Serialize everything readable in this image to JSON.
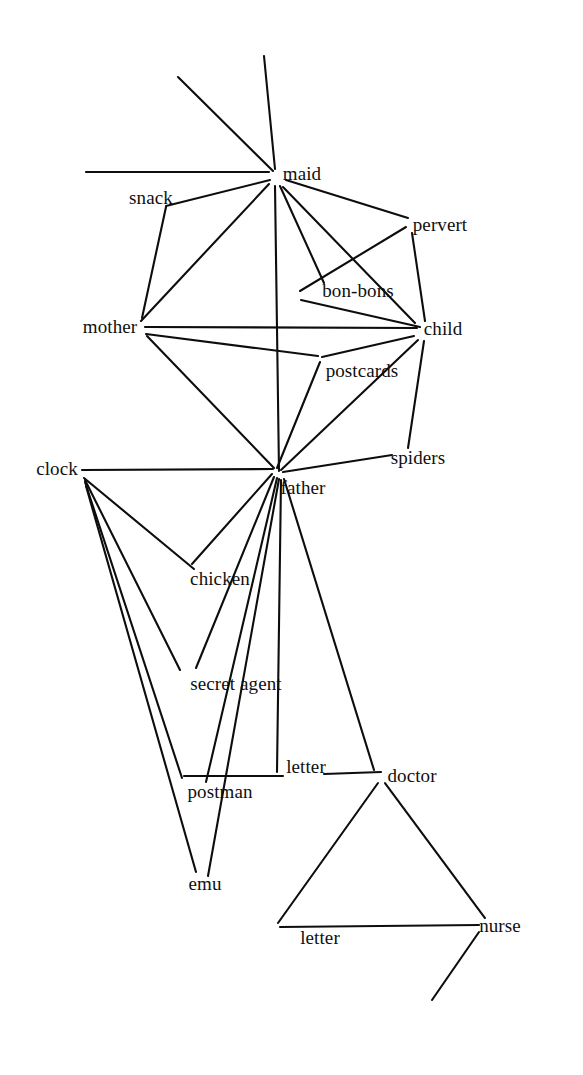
{
  "diagram": {
    "type": "node-link-graph",
    "title": "",
    "background_color": "#ffffff",
    "line_color": "#0d0d0d",
    "text_color": "#101010",
    "width": 583,
    "height": 1075,
    "nodes": [
      {
        "id": "maid",
        "label": "maid",
        "x": 302,
        "y": 173
      },
      {
        "id": "snack",
        "label": "snack",
        "x": 151,
        "y": 197
      },
      {
        "id": "pervert",
        "label": "pervert",
        "x": 440,
        "y": 224
      },
      {
        "id": "bon-bons",
        "label": "bon-bons",
        "x": 358,
        "y": 290
      },
      {
        "id": "mother",
        "label": "mother",
        "x": 110,
        "y": 326
      },
      {
        "id": "child",
        "label": "child",
        "x": 443,
        "y": 328
      },
      {
        "id": "postcards",
        "label": "postcards",
        "x": 362,
        "y": 370
      },
      {
        "id": "spiders",
        "label": "spiders",
        "x": 418,
        "y": 457
      },
      {
        "id": "clock",
        "label": "clock",
        "x": 57,
        "y": 468
      },
      {
        "id": "father",
        "label": "father",
        "x": 303,
        "y": 487
      },
      {
        "id": "chicken",
        "label": "chicken",
        "x": 220,
        "y": 578
      },
      {
        "id": "secret-agent",
        "label": "secret agent",
        "x": 236,
        "y": 683
      },
      {
        "id": "letter-upper",
        "label": "letter",
        "x": 306,
        "y": 766
      },
      {
        "id": "doctor",
        "label": "doctor",
        "x": 412,
        "y": 775
      },
      {
        "id": "postman",
        "label": "postman",
        "x": 220,
        "y": 791
      },
      {
        "id": "emu",
        "label": "emu",
        "x": 205,
        "y": 883
      },
      {
        "id": "letter-lower",
        "label": "letter",
        "x": 320,
        "y": 937
      },
      {
        "id": "nurse",
        "label": "nurse",
        "x": 500,
        "y": 925
      }
    ],
    "edges": [
      {
        "from": "maid",
        "to": "dangle-up-left",
        "x1": 273,
        "y1": 171,
        "x2": 178,
        "y2": 77
      },
      {
        "from": "maid",
        "to": "dangle-up",
        "x1": 275,
        "y1": 169,
        "x2": 264,
        "y2": 56
      },
      {
        "from": "maid",
        "to": "dangle-left",
        "x1": 269,
        "y1": 172,
        "x2": 86,
        "y2": 172
      },
      {
        "from": "maid",
        "to": "snack",
        "x1": 270,
        "y1": 180,
        "x2": 166,
        "y2": 206
      },
      {
        "from": "snack",
        "to": "mother",
        "x1": 166,
        "y1": 207,
        "x2": 142,
        "y2": 318
      },
      {
        "from": "maid",
        "to": "mother",
        "x1": 269,
        "y1": 184,
        "x2": 141,
        "y2": 321
      },
      {
        "from": "maid",
        "to": "father",
        "x1": 275,
        "y1": 186,
        "x2": 279,
        "y2": 471
      },
      {
        "from": "maid",
        "to": "bon-bons",
        "x1": 280,
        "y1": 186,
        "x2": 324,
        "y2": 283
      },
      {
        "from": "maid",
        "to": "child",
        "x1": 283,
        "y1": 187,
        "x2": 415,
        "y2": 323
      },
      {
        "from": "maid",
        "to": "pervert",
        "x1": 286,
        "y1": 180,
        "x2": 408,
        "y2": 218
      },
      {
        "from": "pervert",
        "to": "bon-bons-left",
        "x1": 406,
        "y1": 227,
        "x2": 300,
        "y2": 291
      },
      {
        "from": "pervert",
        "to": "child",
        "x1": 412,
        "y1": 233,
        "x2": 425,
        "y2": 321
      },
      {
        "from": "bon-bons",
        "to": "child",
        "x1": 301,
        "y1": 300,
        "x2": 420,
        "y2": 327
      },
      {
        "from": "mother",
        "to": "child",
        "x1": 145,
        "y1": 327,
        "x2": 417,
        "y2": 328
      },
      {
        "from": "mother",
        "to": "postcards",
        "x1": 146,
        "y1": 334,
        "x2": 318,
        "y2": 356
      },
      {
        "from": "mother",
        "to": "father",
        "x1": 147,
        "y1": 336,
        "x2": 274,
        "y2": 468
      },
      {
        "from": "child",
        "to": "postcards-left",
        "x1": 414,
        "y1": 336,
        "x2": 322,
        "y2": 357
      },
      {
        "from": "postcards",
        "to": "father",
        "x1": 320,
        "y1": 362,
        "x2": 277,
        "y2": 468
      },
      {
        "from": "child",
        "to": "father",
        "x1": 418,
        "y1": 340,
        "x2": 281,
        "y2": 470
      },
      {
        "from": "child",
        "to": "spiders",
        "x1": 424,
        "y1": 341,
        "x2": 408,
        "y2": 448
      },
      {
        "from": "spiders",
        "to": "father",
        "x1": 392,
        "y1": 455,
        "x2": 283,
        "y2": 472
      },
      {
        "from": "clock",
        "to": "father",
        "x1": 82,
        "y1": 470,
        "x2": 273,
        "y2": 469
      },
      {
        "from": "clock",
        "to": "chicken",
        "x1": 84,
        "y1": 478,
        "x2": 194,
        "y2": 569
      },
      {
        "from": "clock",
        "to": "secret-agent",
        "x1": 85,
        "y1": 480,
        "x2": 180,
        "y2": 670
      },
      {
        "from": "clock",
        "to": "postman",
        "x1": 85,
        "y1": 482,
        "x2": 182,
        "y2": 778
      },
      {
        "from": "clock",
        "to": "emu",
        "x1": 86,
        "y1": 486,
        "x2": 196,
        "y2": 872
      },
      {
        "from": "father",
        "to": "chicken",
        "x1": 272,
        "y1": 474,
        "x2": 192,
        "y2": 564
      },
      {
        "from": "father",
        "to": "secret-agent",
        "x1": 274,
        "y1": 477,
        "x2": 196,
        "y2": 668
      },
      {
        "from": "father",
        "to": "postman",
        "x1": 277,
        "y1": 478,
        "x2": 206,
        "y2": 782
      },
      {
        "from": "father",
        "to": "emu",
        "x1": 279,
        "y1": 479,
        "x2": 208,
        "y2": 876
      },
      {
        "from": "father",
        "to": "letter-upper",
        "x1": 281,
        "y1": 480,
        "x2": 277,
        "y2": 772
      },
      {
        "from": "father",
        "to": "doctor",
        "x1": 284,
        "y1": 479,
        "x2": 374,
        "y2": 770
      },
      {
        "from": "postman",
        "to": "letter-upper",
        "x1": 184,
        "y1": 776,
        "x2": 283,
        "y2": 776
      },
      {
        "from": "letter-upper",
        "to": "doctor",
        "x1": 324,
        "y1": 774,
        "x2": 381,
        "y2": 772
      },
      {
        "from": "doctor",
        "to": "letter-lower",
        "x1": 378,
        "y1": 783,
        "x2": 278,
        "y2": 923
      },
      {
        "from": "doctor",
        "to": "nurse",
        "x1": 385,
        "y1": 783,
        "x2": 485,
        "y2": 918
      },
      {
        "from": "letter-lower",
        "to": "nurse",
        "x1": 280,
        "y1": 927,
        "x2": 479,
        "y2": 925
      },
      {
        "from": "nurse",
        "to": "dangle-down-left",
        "x1": 479,
        "y1": 932,
        "x2": 432,
        "y2": 1000
      }
    ]
  }
}
